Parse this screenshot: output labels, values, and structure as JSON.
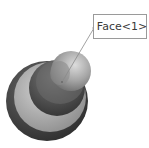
{
  "viewport": {
    "background": "#ffffff"
  },
  "model": {
    "outer_rim_color": "#4a4a4a",
    "outer_ring_color": "#b8b8b8",
    "middle_tier_color": "#5a5a5a",
    "ball_color": "#a8a8a8",
    "ball_highlight": "#d4d4d4"
  },
  "callout": {
    "label": "Face<1>",
    "border_color": "#9a9a9a",
    "leader_color": "#8a8a8a"
  }
}
